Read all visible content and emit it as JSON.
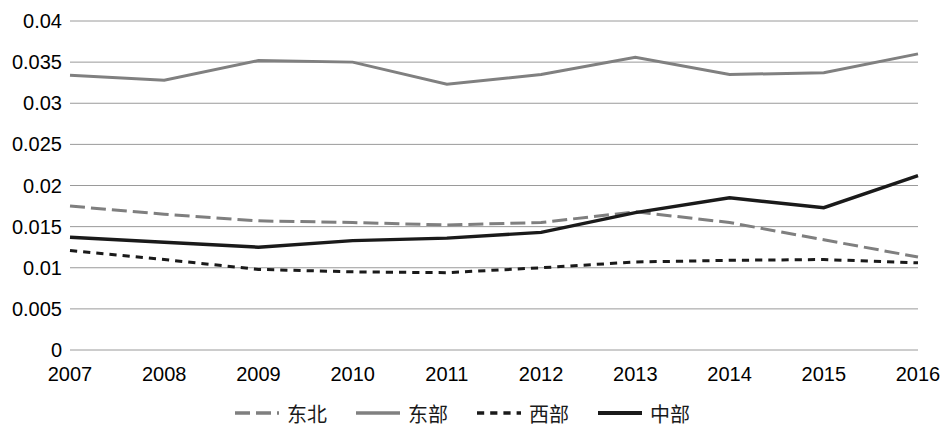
{
  "chart_data": {
    "type": "line",
    "title": "",
    "subtitle": "",
    "xlabel": "",
    "ylabel": "",
    "categories": [
      "2007",
      "2008",
      "2009",
      "2010",
      "2011",
      "2012",
      "2013",
      "2014",
      "2015",
      "2016"
    ],
    "ylim": [
      0,
      0.04
    ],
    "yticks": [
      "0",
      "0.005",
      "0.01",
      "0.015",
      "0.02",
      "0.025",
      "0.03",
      "0.035",
      "0.04"
    ],
    "ytick_values": [
      0,
      0.005,
      0.01,
      0.015,
      0.02,
      0.025,
      0.03,
      0.035,
      0.04
    ],
    "grid": true,
    "grid_axis": "y",
    "legend_position": "bottom",
    "series": [
      {
        "name": "东北",
        "style": "long-dashed",
        "color": "#7f7f7f",
        "width": 3,
        "values": [
          0.0175,
          0.0165,
          0.0157,
          0.0155,
          0.0152,
          0.0155,
          0.0168,
          0.0155,
          0.0134,
          0.0113
        ]
      },
      {
        "name": "东部",
        "style": "solid",
        "color": "#808080",
        "width": 3,
        "values": [
          0.0334,
          0.0328,
          0.0352,
          0.035,
          0.0323,
          0.0335,
          0.0356,
          0.0335,
          0.0337,
          0.036
        ]
      },
      {
        "name": "西部",
        "style": "short-dashed",
        "color": "#1a1a1a",
        "width": 3,
        "values": [
          0.0121,
          0.011,
          0.0098,
          0.0095,
          0.0094,
          0.01,
          0.0107,
          0.0109,
          0.011,
          0.0106
        ]
      },
      {
        "name": "中部",
        "style": "solid",
        "color": "#1a1a1a",
        "width": 3.4,
        "values": [
          0.0137,
          0.0131,
          0.0125,
          0.0133,
          0.0136,
          0.0143,
          0.0167,
          0.0185,
          0.0173,
          0.0212
        ]
      }
    ]
  },
  "legend": {
    "items": [
      {
        "label": "东北"
      },
      {
        "label": "东部"
      },
      {
        "label": "西部"
      },
      {
        "label": "中部"
      }
    ]
  },
  "colors": {
    "gridline": "#9a9a9a",
    "axis_text": "#000000",
    "background": "#ffffff"
  }
}
